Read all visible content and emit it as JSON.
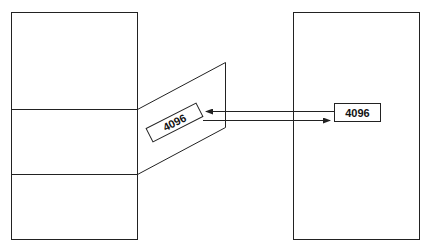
{
  "diagram": {
    "type": "memory-block-transfer",
    "stroke_color": "#222222",
    "background": "#ffffff",
    "left_block": {
      "sections": 3,
      "label": ""
    },
    "right_block": {
      "label": ""
    },
    "mapped_segment": {
      "label": "4096"
    },
    "right_label": {
      "label": "4096"
    },
    "arrows": [
      {
        "direction": "left",
        "from": "right_label",
        "to": "mapped_segment"
      },
      {
        "direction": "right",
        "from": "mapped_segment",
        "to": "right_label"
      }
    ]
  }
}
